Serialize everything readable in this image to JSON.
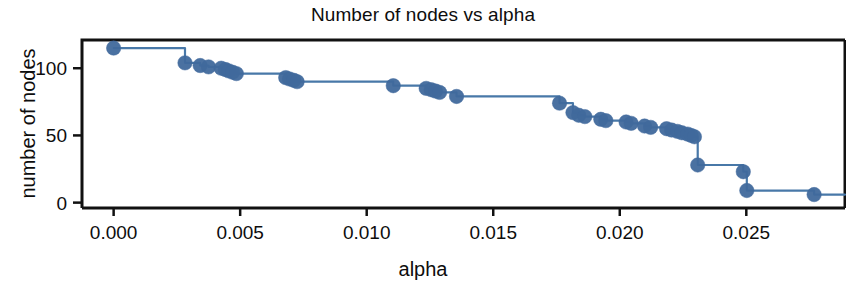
{
  "chart": {
    "title": "Number of nodes vs alpha",
    "xlabel": "alpha",
    "ylabel": "number of nodes"
  },
  "axes": {
    "x_ticks": [
      "0.000",
      "0.005",
      "0.010",
      "0.015",
      "0.020",
      "0.025"
    ],
    "y_ticks": [
      "0",
      "50",
      "100"
    ]
  },
  "style": {
    "line_color": "#4878a8",
    "marker_color": "#40699c",
    "axis_color": "#111111",
    "background": "#ffffff"
  },
  "chart_data": {
    "type": "line",
    "title": "Number of nodes vs alpha",
    "xlabel": "alpha",
    "ylabel": "number of nodes",
    "xlim": [
      -0.00125,
      0.0289
    ],
    "ylim": [
      -4,
      121
    ],
    "x_ticks": [
      0.0,
      0.005,
      0.01,
      0.015,
      0.02,
      0.025
    ],
    "y_ticks": [
      0,
      50,
      100
    ],
    "grid": false,
    "legend": null,
    "drawstyle": "steps-post",
    "markers": true,
    "series": [
      {
        "name": "number of nodes",
        "x": [
          0.0,
          0.00282,
          0.00342,
          0.00375,
          0.00425,
          0.00442,
          0.00455,
          0.0047,
          0.00485,
          0.0068,
          0.00695,
          0.00712,
          0.00725,
          0.01105,
          0.01235,
          0.01255,
          0.01272,
          0.01288,
          0.01355,
          0.01762,
          0.01815,
          0.01838,
          0.01862,
          0.01925,
          0.01945,
          0.02025,
          0.02045,
          0.02098,
          0.02122,
          0.02185,
          0.02205,
          0.02228,
          0.02245,
          0.02268,
          0.02282,
          0.02295,
          0.02308,
          0.02488,
          0.02502,
          0.02768
        ],
        "y": [
          115,
          104,
          102,
          101,
          100,
          99,
          98,
          97,
          96,
          93,
          92,
          91,
          90,
          87,
          85,
          84,
          83,
          82,
          79,
          74,
          67,
          65,
          64,
          62,
          61,
          60,
          59,
          57,
          56,
          55,
          54,
          53,
          52,
          51,
          50,
          49,
          28,
          23,
          9,
          6
        ]
      }
    ]
  }
}
